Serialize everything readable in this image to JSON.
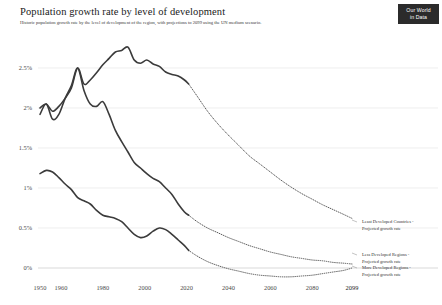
{
  "header": {
    "title": "Population growth rate by level of development",
    "subtitle": "Historic population growth rate by the level of development of the region, with projections to 2099 using the UN medium scenario.",
    "logo_line1": "Our World",
    "logo_line2": "in Data"
  },
  "annotations": {
    "least_developed": "Least Developed Countries -\nProjected growth rate",
    "less_developed": "Less Developed Regions -\nProjected growth rate",
    "more_developed": "More Developed Regions -\nProjected growth rate"
  },
  "chart_data": {
    "type": "line",
    "title": "Population growth rate by level of development",
    "subtitle": "Historic population growth rate by the level of development of the region, with projections to 2099 using the UN medium scenario.",
    "xlabel": "",
    "ylabel": "",
    "xlim": [
      1950,
      2099
    ],
    "ylim": [
      -0.15,
      2.85
    ],
    "grid": true,
    "grid_axis": "y",
    "legend_position": "right-inline",
    "yticks": [
      0,
      0.5,
      1,
      1.5,
      2,
      2.5
    ],
    "ytick_labels": [
      "0%",
      "0.5%",
      "1%",
      "1.5%",
      "2%",
      "2.5%"
    ],
    "xticks": [
      1950,
      1960,
      1980,
      2000,
      2020,
      2040,
      2060,
      2080,
      2099
    ],
    "xtick_labels": [
      "1950",
      "1960",
      "1980",
      "2000",
      "2020",
      "2040",
      "2060",
      "2080",
      "2099"
    ],
    "value_unit": "percent",
    "projection_start_year": 2021,
    "series": [
      {
        "name": "Least Developed Countries",
        "label": "Least Developed Countries - Projected growth rate",
        "color": "#3b3b3b",
        "historic_style": "solid",
        "projected_style": "dotted",
        "x": [
          1950,
          1953,
          1956,
          1959,
          1962,
          1965,
          1968,
          1971,
          1974,
          1977,
          1980,
          1983,
          1986,
          1989,
          1992,
          1995,
          1998,
          2001,
          2004,
          2007,
          2010,
          2013,
          2016,
          2019,
          2021,
          2025,
          2030,
          2035,
          2040,
          2045,
          2050,
          2055,
          2060,
          2065,
          2070,
          2075,
          2080,
          2085,
          2090,
          2095,
          2099
        ],
        "y": [
          2.0,
          2.05,
          1.96,
          2.02,
          2.12,
          2.25,
          2.5,
          2.3,
          2.35,
          2.44,
          2.54,
          2.62,
          2.7,
          2.72,
          2.76,
          2.6,
          2.56,
          2.6,
          2.55,
          2.52,
          2.45,
          2.42,
          2.4,
          2.35,
          2.3,
          2.15,
          1.96,
          1.8,
          1.66,
          1.53,
          1.4,
          1.3,
          1.2,
          1.1,
          1.01,
          0.93,
          0.86,
          0.79,
          0.73,
          0.67,
          0.62
        ]
      },
      {
        "name": "Less Developed Regions",
        "label": "Less Developed Regions - Projected growth rate",
        "color": "#3b3b3b",
        "historic_style": "solid",
        "projected_style": "dotted",
        "x": [
          1950,
          1953,
          1956,
          1959,
          1962,
          1965,
          1968,
          1971,
          1974,
          1977,
          1980,
          1983,
          1986,
          1989,
          1992,
          1995,
          1998,
          2001,
          2004,
          2007,
          2010,
          2013,
          2016,
          2019,
          2021,
          2025,
          2030,
          2035,
          2040,
          2045,
          2050,
          2055,
          2060,
          2065,
          2070,
          2075,
          2080,
          2085,
          2090,
          2095,
          2099
        ],
        "y": [
          1.92,
          2.05,
          1.86,
          1.92,
          2.12,
          2.28,
          2.5,
          2.22,
          2.05,
          2.02,
          2.08,
          1.92,
          1.72,
          1.58,
          1.45,
          1.32,
          1.25,
          1.18,
          1.12,
          1.08,
          1.0,
          0.92,
          0.8,
          0.7,
          0.66,
          0.58,
          0.5,
          0.44,
          0.38,
          0.33,
          0.28,
          0.24,
          0.2,
          0.17,
          0.14,
          0.12,
          0.1,
          0.09,
          0.07,
          0.06,
          0.05
        ]
      },
      {
        "name": "More Developed Regions",
        "label": "More Developed Regions - Projected growth rate",
        "color": "#3b3b3b",
        "historic_style": "solid",
        "projected_style": "dotted",
        "x": [
          1950,
          1953,
          1956,
          1959,
          1962,
          1965,
          1968,
          1971,
          1974,
          1977,
          1980,
          1983,
          1986,
          1989,
          1992,
          1995,
          1998,
          2001,
          2004,
          2007,
          2010,
          2013,
          2016,
          2019,
          2021,
          2025,
          2030,
          2035,
          2040,
          2045,
          2050,
          2055,
          2060,
          2065,
          2070,
          2075,
          2080,
          2085,
          2090,
          2095,
          2099
        ],
        "y": [
          1.18,
          1.22,
          1.2,
          1.13,
          1.05,
          0.98,
          0.88,
          0.84,
          0.8,
          0.72,
          0.66,
          0.64,
          0.62,
          0.58,
          0.5,
          0.42,
          0.38,
          0.4,
          0.46,
          0.5,
          0.48,
          0.42,
          0.35,
          0.28,
          0.22,
          0.15,
          0.08,
          0.03,
          -0.01,
          -0.04,
          -0.07,
          -0.09,
          -0.1,
          -0.11,
          -0.11,
          -0.1,
          -0.09,
          -0.07,
          -0.05,
          -0.03,
          0.0
        ]
      }
    ]
  }
}
